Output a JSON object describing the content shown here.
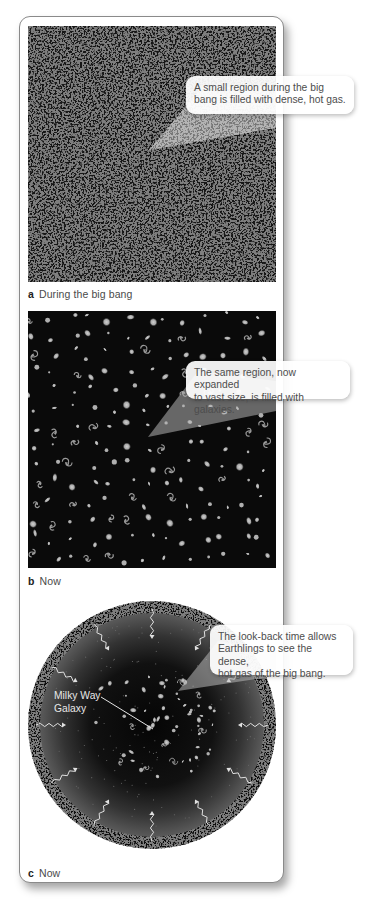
{
  "figure": {
    "panels": [
      {
        "id": "a",
        "letter": "a",
        "caption": "During the big bang",
        "callout": "A small region during the big bang is filled with dense, hot gas.",
        "callout_lines": [
          "A small region during the big",
          "bang is filled with dense, hot gas."
        ],
        "content": "dense hot gas noise texture"
      },
      {
        "id": "b",
        "letter": "b",
        "caption": "Now",
        "callout": "The same region, now expanded to vast size, is filled with galaxies.",
        "callout_lines": [
          "The same region, now expanded",
          "to vast size, is filled with galaxies."
        ],
        "content": "field of galaxies on black background"
      },
      {
        "id": "c",
        "letter": "c",
        "caption": "Now",
        "callout": "The look-back time allows Earthlings to see the dense, hot gas of the big bang.",
        "callout_lines": [
          "The look-back time allows",
          "Earthlings to see the dense,",
          "hot gas of the big bang."
        ],
        "label": "Milky Way Galaxy",
        "label_lines": [
          "Milky Way",
          "Galaxy"
        ],
        "content": "observable universe circle with galaxies, outer ring of big bang gas, inward light arrows"
      }
    ]
  },
  "colors": {
    "gas_grey": "#808080",
    "gas_dark": "#111111",
    "space_black": "#0a0a0a",
    "galaxy_grey": "#b5b5b5",
    "callout_text": "#4d4d4d",
    "card_border": "#8a8a8a"
  }
}
